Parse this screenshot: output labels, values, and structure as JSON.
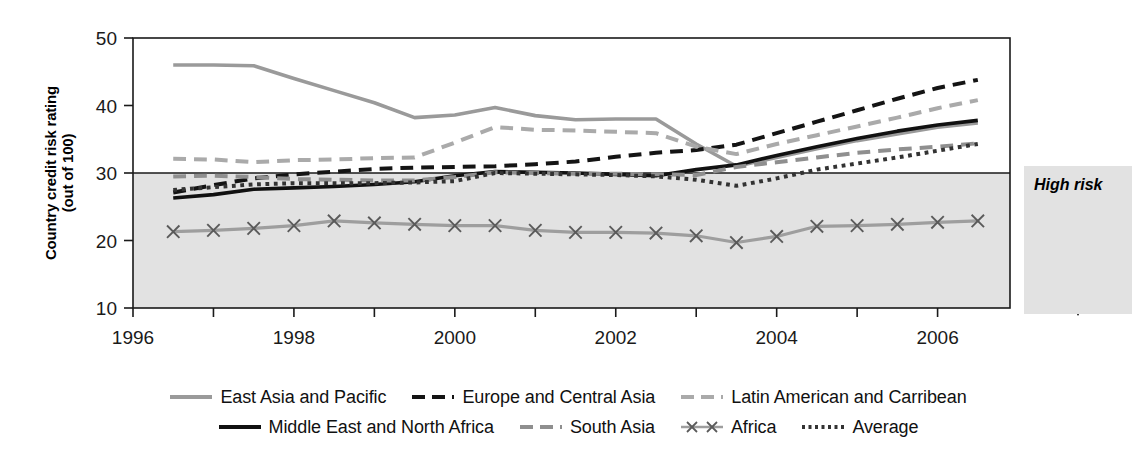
{
  "axes": {
    "ylabel_line1": "Country credit risk rating",
    "ylabel_line2": "(out of 100)",
    "yticks": [
      "10",
      "20",
      "30",
      "40",
      "50"
    ],
    "xticks": [
      "1996",
      "1998",
      "2000",
      "2002",
      "2004",
      "2006"
    ]
  },
  "annotation": {
    "high_risk_label": "High risk",
    "arrow_icon": "down-arrow-icon"
  },
  "legend": {
    "row1": [
      {
        "label": "East Asia and Pacific",
        "style": "solid",
        "color": "#9a9a9a",
        "width": 4
      },
      {
        "label": "Europe and Central Asia",
        "style": "dashed",
        "color": "#141414",
        "width": 4
      },
      {
        "label": "Latin American and Carribean",
        "style": "dashed",
        "color": "#aaaaaa",
        "width": 4
      }
    ],
    "row2": [
      {
        "label": "Middle East and North Africa",
        "style": "solid",
        "color": "#111111",
        "width": 4
      },
      {
        "label": "South Asia",
        "style": "dashed",
        "color": "#8f8f8f",
        "width": 4
      },
      {
        "label": "Africa",
        "style": "marker-x",
        "color": "#9e9e9e",
        "width": 3
      },
      {
        "label": "Average",
        "style": "dotted",
        "color": "#333333",
        "width": 4
      }
    ]
  },
  "chart_data": {
    "type": "line",
    "title": "",
    "xlabel": "",
    "ylabel": "Country credit risk rating (out of 100)",
    "xlim": [
      1996,
      2006.9
    ],
    "ylim": [
      10,
      50
    ],
    "grid": false,
    "threshold_line": 30,
    "shaded_region": {
      "from": 10,
      "to": 30,
      "label": "High risk",
      "color": "#e2e2e2"
    },
    "legend_position": "bottom",
    "x": [
      1996.5,
      1997.0,
      1997.5,
      1998.0,
      1998.5,
      1999.0,
      1999.5,
      2000.0,
      2000.5,
      2001.0,
      2001.5,
      2002.0,
      2002.5,
      2003.0,
      2003.5,
      2004.0,
      2004.5,
      2005.0,
      2005.5,
      2006.0,
      2006.5
    ],
    "series": [
      {
        "name": "East Asia and Pacific",
        "style": "solid",
        "color": "#9a9a9a",
        "values": [
          46.0,
          46.0,
          45.9,
          44.0,
          42.2,
          40.4,
          38.2,
          38.6,
          39.7,
          38.5,
          37.9,
          38.0,
          38.0,
          34.3,
          31.0,
          32.3,
          33.6,
          34.8,
          35.8,
          36.8,
          37.4
        ]
      },
      {
        "name": "Europe and Central Asia",
        "style": "dashed",
        "color": "#141414",
        "values": [
          27.1,
          28.2,
          29.2,
          29.8,
          30.2,
          30.6,
          30.8,
          30.9,
          31.0,
          31.3,
          31.7,
          32.4,
          33.0,
          33.4,
          34.2,
          35.9,
          37.6,
          39.3,
          41.0,
          42.6,
          43.8
        ]
      },
      {
        "name": "Latin American and Carribean",
        "style": "dashed",
        "color": "#aaaaaa",
        "values": [
          32.1,
          32.0,
          31.6,
          31.9,
          32.0,
          32.2,
          32.3,
          34.5,
          36.8,
          36.4,
          36.3,
          36.1,
          35.9,
          33.9,
          32.8,
          34.3,
          35.6,
          36.9,
          38.2,
          39.6,
          40.8
        ]
      },
      {
        "name": "Middle East and North Africa",
        "style": "solid",
        "color": "#111111",
        "values": [
          26.3,
          26.8,
          27.6,
          27.8,
          28.0,
          28.3,
          28.7,
          29.6,
          30.2,
          30.1,
          30.0,
          29.8,
          29.6,
          30.5,
          31.2,
          32.6,
          33.9,
          35.1,
          36.2,
          37.1,
          37.8
        ]
      },
      {
        "name": "South Asia",
        "style": "dashed",
        "color": "#8f8f8f",
        "values": [
          29.5,
          29.6,
          29.4,
          29.1,
          29.0,
          28.9,
          28.9,
          29.4,
          30.1,
          30.0,
          29.9,
          29.9,
          29.8,
          29.7,
          30.9,
          31.6,
          32.3,
          33.0,
          33.5,
          33.9,
          34.4
        ]
      },
      {
        "name": "Africa",
        "style": "marker-x",
        "color": "#9e9e9e",
        "values": [
          21.3,
          21.5,
          21.8,
          22.2,
          22.9,
          22.6,
          22.4,
          22.2,
          22.2,
          21.5,
          21.2,
          21.2,
          21.1,
          20.7,
          19.7,
          20.6,
          22.1,
          22.2,
          22.4,
          22.7,
          22.9
        ]
      },
      {
        "name": "Average",
        "style": "dotted",
        "color": "#333333",
        "values": [
          27.5,
          27.9,
          28.3,
          28.5,
          28.5,
          28.5,
          28.6,
          28.8,
          30.0,
          29.9,
          29.8,
          29.7,
          29.5,
          29.0,
          28.1,
          29.2,
          30.5,
          31.4,
          32.3,
          33.3,
          34.3
        ]
      }
    ]
  }
}
